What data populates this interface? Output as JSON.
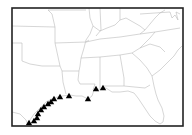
{
  "map": {
    "region": "Southeastern United States",
    "frame": {
      "x": 12,
      "y": 8,
      "w": 171,
      "h": 118,
      "stroke": "#222222"
    },
    "border_color": "#bbbbbb",
    "marker_color": "#000000",
    "markers": [
      {
        "x": 29,
        "y": 123
      },
      {
        "x": 34,
        "y": 121
      },
      {
        "x": 37,
        "y": 118
      },
      {
        "x": 38,
        "y": 114
      },
      {
        "x": 41,
        "y": 110
      },
      {
        "x": 44,
        "y": 107
      },
      {
        "x": 48,
        "y": 104
      },
      {
        "x": 51,
        "y": 102
      },
      {
        "x": 54,
        "y": 99
      },
      {
        "x": 60,
        "y": 97
      },
      {
        "x": 69,
        "y": 96
      },
      {
        "x": 88,
        "y": 99
      },
      {
        "x": 96,
        "y": 89
      },
      {
        "x": 103,
        "y": 88
      }
    ]
  }
}
